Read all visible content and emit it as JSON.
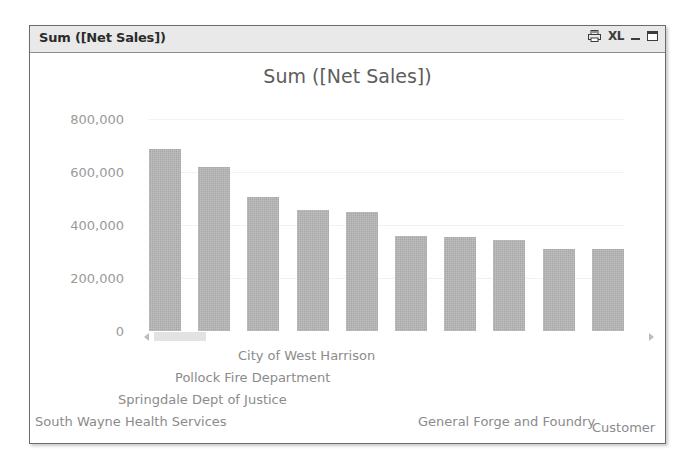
{
  "window": {
    "title": "Sum ([Net Sales])",
    "buttons": [
      {
        "name": "print-icon",
        "label": ""
      },
      {
        "name": "excel-export-icon",
        "label": "XL"
      },
      {
        "name": "minimize-button",
        "label": ""
      },
      {
        "name": "maximize-button",
        "label": ""
      }
    ]
  },
  "scrollbar": {
    "left_arrow": "◄",
    "right_arrow": "►"
  },
  "colors": {
    "bar": "#a9a9a9",
    "axis_text": "#9a9a9a",
    "title_text": "#5d5d5d",
    "titlebar_bg": "#e9e9e9",
    "frame_border": "#6b6b6b"
  },
  "chart_data": {
    "type": "bar",
    "title": "Sum ([Net Sales])",
    "xlabel": "Customer",
    "ylabel": "",
    "grid": true,
    "legend": "none",
    "ylim": [
      0,
      800000
    ],
    "yticks": [
      800000,
      600000,
      400000,
      200000,
      0
    ],
    "ytick_labels": [
      "800,000",
      "600,000",
      "400,000",
      "200,000",
      "0"
    ],
    "categories": [
      "South Wayne Health Services",
      "Springdale Dept of Justice",
      "Pollock Fire Department",
      "City of West Harrison",
      "General Forge and Foundry",
      "",
      "",
      "",
      "",
      ""
    ],
    "visible_category_labels": [
      "City of West Harrison",
      "Pollock Fire Department",
      "Springdale Dept of Justice",
      "South Wayne Health Services",
      "General Forge and Foundry"
    ],
    "values": [
      685000,
      620000,
      505000,
      455000,
      448000,
      357000,
      355000,
      342000,
      310000,
      308000
    ]
  }
}
